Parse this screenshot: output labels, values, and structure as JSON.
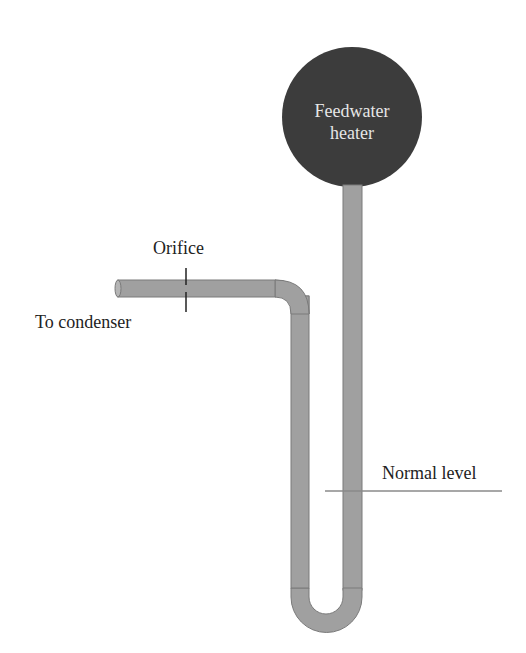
{
  "diagram": {
    "heater": {
      "line1": "Feedwater",
      "line2": "heater",
      "fill": "#3c3c3c"
    },
    "labels": {
      "orifice": "Orifice",
      "to_condenser": "To condenser",
      "normal_level": "Normal level"
    },
    "pipe": {
      "fill": "#9e9e9e",
      "stroke": "#7a7a7a"
    },
    "level_line_color": "#8a8a8a"
  }
}
